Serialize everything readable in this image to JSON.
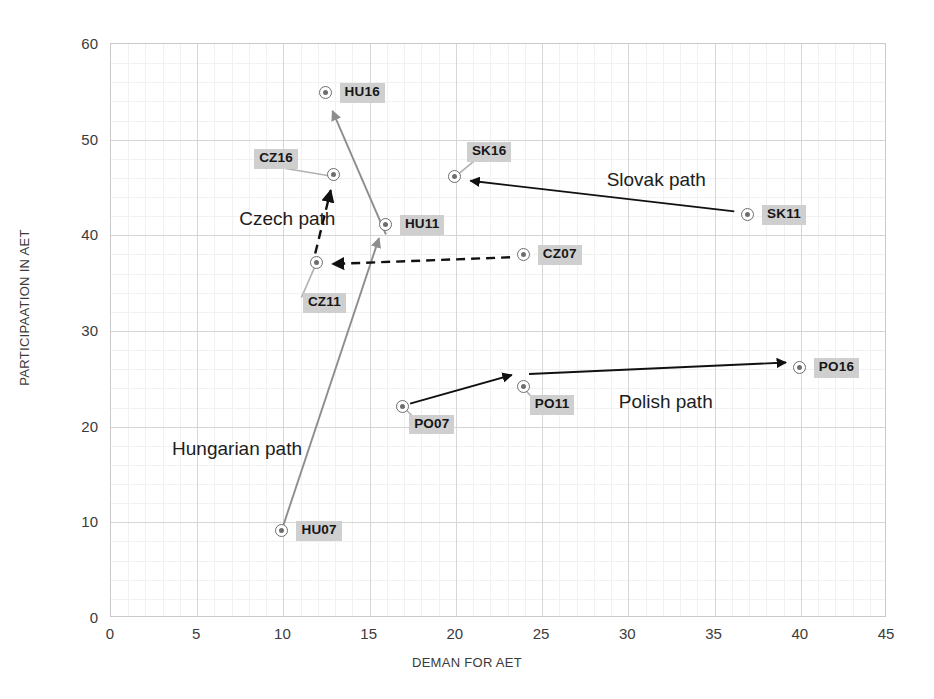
{
  "chart_data": {
    "type": "scatter",
    "title": "",
    "xlabel": "DEMAN FOR AET",
    "ylabel": "PARTICIPAATION IN AET",
    "xlim": [
      0,
      45
    ],
    "ylim": [
      0,
      60
    ],
    "xticks": [
      0,
      5,
      10,
      15,
      20,
      25,
      30,
      35,
      40,
      45
    ],
    "yticks": [
      0,
      10,
      20,
      30,
      40,
      50,
      60
    ],
    "grid": true,
    "legend": "none",
    "points": [
      {
        "label": "HU07",
        "x": 10.0,
        "y": 9.0,
        "label_dx": 14,
        "label_dy": -1
      },
      {
        "label": "HU11",
        "x": 16.0,
        "y": 41.0,
        "label_dx": 14,
        "label_dy": -1
      },
      {
        "label": "HU16",
        "x": 12.5,
        "y": 54.8,
        "label_dx": 14,
        "label_dy": -1
      },
      {
        "label": "CZ11",
        "x": 12.0,
        "y": 37.0,
        "label_dx": -14,
        "label_dy": 39
      },
      {
        "label": "CZ16",
        "x": 13.0,
        "y": 46.2,
        "label_dx": -80,
        "label_dy": -17
      },
      {
        "label": "CZ07",
        "x": 24.0,
        "y": 37.8,
        "label_dx": 14,
        "label_dy": -1
      },
      {
        "label": "SK11",
        "x": 37.0,
        "y": 42.0,
        "label_dx": 14,
        "label_dy": -1
      },
      {
        "label": "SK16",
        "x": 20.0,
        "y": 46.0,
        "label_dx": 12,
        "label_dy": -26
      },
      {
        "label": "PO07",
        "x": 17.0,
        "y": 22.0,
        "label_dx": 6,
        "label_dy": 17
      },
      {
        "label": "PO11",
        "x": 24.0,
        "y": 24.0,
        "label_dx": 6,
        "label_dy": 17
      },
      {
        "label": "PO16",
        "x": 40.0,
        "y": 26.0,
        "label_dx": 14,
        "label_dy": -1
      }
    ],
    "annotations": [
      {
        "name": "czech-path",
        "text": "Czech path",
        "x": 7.5,
        "y": 41.5
      },
      {
        "name": "slovak-path",
        "text": "Slovak path",
        "x": 28.8,
        "y": 45.6
      },
      {
        "name": "polish-path",
        "text": "Polish path",
        "x": 29.5,
        "y": 22.4
      },
      {
        "name": "hungarian-path",
        "text": "Hungarian path",
        "x": 3.6,
        "y": 17.5
      }
    ],
    "arrows": [
      {
        "name": "hungarian-arrow-07-11",
        "from": {
          "x": 10.0,
          "y": 9.3
        },
        "to": {
          "x": 15.6,
          "y": 39.6
        },
        "style": "solid",
        "color": "#8d8d8d"
      },
      {
        "name": "hungarian-arrow-11-16",
        "from": {
          "x": 16.0,
          "y": 40.0
        },
        "to": {
          "x": 12.9,
          "y": 52.9
        },
        "style": "solid",
        "color": "#8d8d8d"
      },
      {
        "name": "czech-arrow-07-11",
        "from": {
          "x": 23.2,
          "y": 37.6
        },
        "to": {
          "x": 12.9,
          "y": 36.9
        },
        "style": "dashed",
        "color": "#111111"
      },
      {
        "name": "czech-arrow-11-16",
        "from": {
          "x": 11.9,
          "y": 38.0
        },
        "to": {
          "x": 12.8,
          "y": 44.6
        },
        "style": "dashed",
        "color": "#111111"
      },
      {
        "name": "slovak-arrow-11-16",
        "from": {
          "x": 36.2,
          "y": 42.4
        },
        "to": {
          "x": 20.9,
          "y": 45.6
        },
        "style": "solid",
        "color": "#111111"
      },
      {
        "name": "polish-arrow-07-11",
        "from": {
          "x": 17.4,
          "y": 22.3
        },
        "to": {
          "x": 23.3,
          "y": 25.3
        },
        "style": "solid",
        "color": "#111111"
      },
      {
        "name": "polish-arrow-11-16",
        "from": {
          "x": 24.3,
          "y": 25.4
        },
        "to": {
          "x": 39.2,
          "y": 26.6
        },
        "style": "solid",
        "color": "#111111"
      }
    ],
    "leaders": [
      {
        "name": "leader-cz16",
        "from": {
          "x": 12.8,
          "y": 46.1
        },
        "to": {
          "x": 10.1,
          "y": 46.9
        }
      },
      {
        "name": "leader-cz11",
        "from": {
          "x": 11.9,
          "y": 36.7
        },
        "to": {
          "x": 11.1,
          "y": 33.4
        }
      },
      {
        "name": "leader-sk16",
        "from": {
          "x": 20.2,
          "y": 46.3
        },
        "to": {
          "x": 21.4,
          "y": 48.1
        }
      },
      {
        "name": "leader-po07",
        "from": {
          "x": 17.1,
          "y": 21.8
        },
        "to": {
          "x": 17.7,
          "y": 20.7
        }
      },
      {
        "name": "leader-po11",
        "from": {
          "x": 24.1,
          "y": 23.7
        },
        "to": {
          "x": 24.7,
          "y": 22.5
        }
      }
    ]
  },
  "style": {
    "marker_color": "#6e6e6e",
    "label_badge_color": "#cfcfcf",
    "grid_color": "#d6d6d6",
    "minor_grid_color": "#f1f1f1",
    "axis_text_color": "#3b3b3b"
  }
}
